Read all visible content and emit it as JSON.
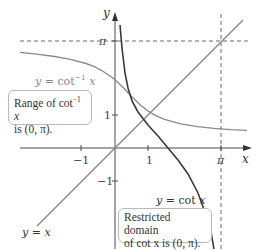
{
  "figure": {
    "axes": {
      "x_label": "x",
      "y_label": "y",
      "x_ticks": [
        "−1",
        "1",
        "π"
      ],
      "y_ticks": [
        "π",
        "1",
        "−1"
      ]
    },
    "curves": {
      "cot": {
        "label": "y = cot x",
        "color": "#3a3a3a"
      },
      "arccot": {
        "label": "y = cot",
        "label_sup": "−1",
        "label_var": " x",
        "color": "#8a8a8a"
      },
      "identity": {
        "label": "y = x",
        "color": "#8a8a8a"
      }
    },
    "callouts": {
      "range": {
        "line1": "Range of cot",
        "line1_sup": "−1",
        "line1_var": " x",
        "line2": "is (0, π)."
      },
      "domain": {
        "line1": "Restricted domain",
        "line2": "of cot x is (0, π)."
      }
    },
    "colors": {
      "axis": "#4a4a4a",
      "dashed": "#6a6a6a",
      "box_border": "#b9b9b9"
    }
  }
}
